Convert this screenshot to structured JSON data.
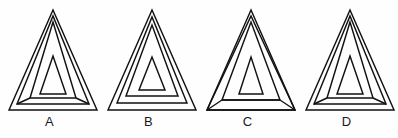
{
  "figure_set": {
    "title": "Nested triangle figure set",
    "background_color": "#fefefe",
    "line_color": "#111111",
    "label_color": "#1a1a1a",
    "figures": [
      {
        "label": "A",
        "description": "Outer triangle with a nested middle triangle whose base corners taper inward, plus an innermost small triangle; apex lines converge at the top vertex.",
        "shape_count": 3,
        "apex_x": 53,
        "apex_y": 10,
        "base_y": 110,
        "base_left_x": 9,
        "base_right_x": 97,
        "outer": "9,110 53,10 97,110",
        "middle": "17,104 53,16 89,104",
        "middle_inner_base": "30,98 53,22 76,98",
        "inner": "40,94 53,56 66,94",
        "connectors": [
          "17,104 30,98",
          "89,104 76,98"
        ]
      },
      {
        "label": "B",
        "description": "Three plain concentric triangles with parallel sides and no connecting lines between them.",
        "shape_count": 3,
        "apex_x": 53,
        "apex_y": 10,
        "base_y": 110,
        "base_left_x": 9,
        "base_right_x": 97,
        "outer": "9,110 53,10 97,110",
        "middle": "18,103 53,17 88,103",
        "inner_mid": "27,96 53,25 79,96",
        "inner": "40,90 53,57 66,90"
      },
      {
        "label": "C",
        "description": "Outer triangle whose bottom corners are joined by straight lines to the inner triangle band, so the middle band spreads fully to the outer base corners.",
        "shape_count": 3,
        "apex_x": 53,
        "apex_y": 10,
        "base_y": 110,
        "base_left_x": 9,
        "base_right_x": 97,
        "outer": "9,110 53,10 97,110",
        "middle": "9,110 53,16 97,110",
        "inner_band": "24,100 53,22 82,100",
        "inner": "41,94 53,57 65,94",
        "connectors": [
          "9,110 24,100",
          "97,110 82,100",
          "24,100 82,100"
        ]
      },
      {
        "label": "D",
        "description": "Outer triangle with nested middle triangle tapering inward at the base and an innermost small triangle; visually matches figure A.",
        "shape_count": 3,
        "apex_x": 53,
        "apex_y": 10,
        "base_y": 110,
        "base_left_x": 9,
        "base_right_x": 97,
        "outer": "9,110 53,10 97,110",
        "middle": "17,104 53,16 89,104",
        "middle_inner_base": "30,98 53,22 76,98",
        "inner": "40,94 53,56 66,94",
        "connectors": [
          "17,104 30,98",
          "89,104 76,98"
        ]
      }
    ]
  }
}
